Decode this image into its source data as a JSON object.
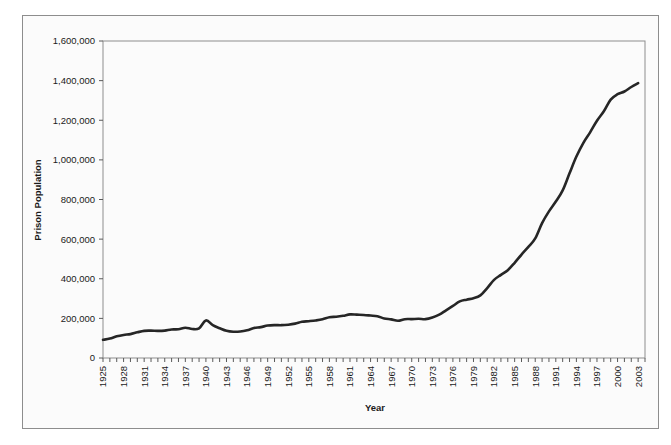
{
  "figure": {
    "background_color": "#ffffff",
    "plot_background_color": "#fbfbfb",
    "frame_color": "#8d8d8d",
    "line_color": "#262626",
    "text_color": "#1a1a1a"
  },
  "chart_data": {
    "type": "line",
    "title": "",
    "xlabel": "Year",
    "ylabel": "Prison Population",
    "xlim": [
      1925,
      2004
    ],
    "ylim": [
      0,
      1600000
    ],
    "grid": false,
    "legend": false,
    "y_ticks": [
      0,
      200000,
      400000,
      600000,
      800000,
      1000000,
      1200000,
      1400000,
      1600000
    ],
    "y_tick_labels": [
      "0",
      "200,000",
      "400,000",
      "600,000",
      "800,000",
      "1,000,000",
      "1,200,000",
      "1,400,000",
      "1,600,000"
    ],
    "x_tick_labels": [
      "1925",
      "1928",
      "1931",
      "1934",
      "1937",
      "1940",
      "1943",
      "1946",
      "1949",
      "1952",
      "1955",
      "1958",
      "1961",
      "1964",
      "1967",
      "1970",
      "1973",
      "1976",
      "1979",
      "1982",
      "1985",
      "1988",
      "1991",
      "1994",
      "1997",
      "2000",
      "2003"
    ],
    "x_tick_label_interval": 3,
    "x_minor_tick_interval": 1,
    "series": [
      {
        "name": "Prison Population",
        "x": [
          1925,
          1926,
          1927,
          1928,
          1929,
          1930,
          1931,
          1932,
          1933,
          1934,
          1935,
          1936,
          1937,
          1938,
          1939,
          1940,
          1941,
          1942,
          1943,
          1944,
          1945,
          1946,
          1947,
          1948,
          1949,
          1950,
          1951,
          1952,
          1953,
          1954,
          1955,
          1956,
          1957,
          1958,
          1959,
          1960,
          1961,
          1962,
          1963,
          1964,
          1965,
          1966,
          1967,
          1968,
          1969,
          1970,
          1971,
          1972,
          1973,
          1974,
          1975,
          1976,
          1977,
          1978,
          1979,
          1980,
          1981,
          1982,
          1983,
          1984,
          1985,
          1986,
          1987,
          1988,
          1989,
          1990,
          1991,
          1992,
          1993,
          1994,
          1995,
          1996,
          1997,
          1998,
          1999,
          2000,
          2001,
          2002,
          2003
        ],
        "values": [
          91669,
          97991,
          109346,
          116390,
          120496,
          129453,
          137082,
          137997,
          136810,
          138316,
          144180,
          145038,
          152741,
          146325,
          149804,
          189735,
          165439,
          150384,
          137220,
          132456,
          133649,
          140079,
          151304,
          155977,
          163749,
          166123,
          165680,
          168233,
          173579,
          182901,
          185780,
          189565,
          195414,
          205643,
          208105,
          212953,
          220149,
          218830,
          217283,
          214336,
          210895,
          199654,
          194896,
          187914,
          196007,
          196429,
          198061,
          196092,
          204211,
          218466,
          240593,
          262833,
          285456,
          294396,
          301470,
          315974,
          353167,
          394374,
          419820,
          443398,
          480568,
          522084,
          560812,
          603732,
          680907,
          739980,
          789610,
          846277,
          932074,
          1016691,
          1085022,
          1138984,
          1197590,
          1245402,
          1304074,
          1331278,
          1345217,
          1367856,
          1387269
        ]
      }
    ],
    "notes": {
      "first_point": {
        "year": 1925,
        "value": 91669
      },
      "peak_1939_1940": {
        "year": 1940,
        "value": 189735
      },
      "dip_1945_1946": {
        "year": 1945,
        "value": 133649
      },
      "plateau_1961_1964": {
        "year": 1961,
        "value": 220149
      },
      "dip_1968_1970": {
        "year": 1968,
        "value": 187914
      },
      "last_point": {
        "year": 2003,
        "value": 1387269
      }
    }
  }
}
